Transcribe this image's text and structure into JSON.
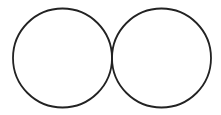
{
  "diagram": {
    "stroke_color": "#222222",
    "background": "#ffffff",
    "circles": [
      {
        "id": "left-circle",
        "cx": 62.5,
        "cy": 58,
        "r": 49.5
      },
      {
        "id": "right-circle",
        "cx": 161.5,
        "cy": 58,
        "r": 49.5
      }
    ]
  }
}
